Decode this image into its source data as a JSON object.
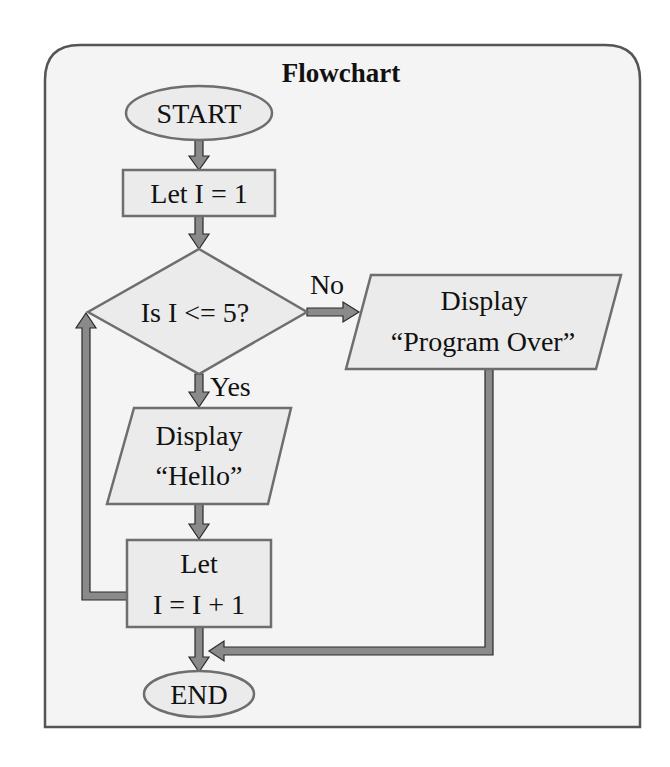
{
  "diagram": {
    "title": "Flowchart",
    "nodes": {
      "start": {
        "type": "terminator",
        "label": "START"
      },
      "init": {
        "type": "process",
        "label": "Let I = 1"
      },
      "decision": {
        "type": "decision",
        "label": "Is I <= 5?"
      },
      "display_hello": {
        "type": "io",
        "lines": [
          "Display",
          "“Hello”"
        ]
      },
      "increment": {
        "type": "process",
        "lines": [
          "Let",
          "I = I + 1"
        ]
      },
      "display_over": {
        "type": "io",
        "lines": [
          "Display",
          "“Program Over”"
        ]
      },
      "end": {
        "type": "terminator",
        "label": "END"
      }
    },
    "edges": [
      {
        "from": "start",
        "to": "init",
        "label": ""
      },
      {
        "from": "init",
        "to": "decision",
        "label": ""
      },
      {
        "from": "decision",
        "to": "display_hello",
        "label": "Yes"
      },
      {
        "from": "decision",
        "to": "display_over",
        "label": "No"
      },
      {
        "from": "display_hello",
        "to": "increment",
        "label": ""
      },
      {
        "from": "increment",
        "to": "decision",
        "label": ""
      },
      {
        "from": "increment",
        "to": "end",
        "label": ""
      },
      {
        "from": "display_over",
        "to": "end",
        "label": ""
      }
    ],
    "edge_labels": {
      "yes": "Yes",
      "no": "No"
    },
    "colors": {
      "panel_bg": "#f4f4f4",
      "shape_fill": "#ebebeb",
      "shape_stroke": "#6e6e6e",
      "arrow_fill": "#8a8a8a"
    }
  }
}
